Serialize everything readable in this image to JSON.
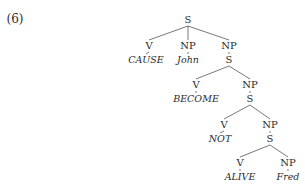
{
  "example_number": "(6)",
  "tree": {
    "nodes": [
      {
        "id": "s0",
        "label": "S",
        "x": 188,
        "y": 20,
        "kind": "cat"
      },
      {
        "id": "v1",
        "label": "V",
        "x": 149,
        "y": 46,
        "kind": "cat"
      },
      {
        "id": "w1",
        "label": "CAUSE",
        "x": 146,
        "y": 60,
        "kind": "word"
      },
      {
        "id": "np1",
        "label": "NP",
        "x": 188,
        "y": 46,
        "kind": "cat"
      },
      {
        "id": "w2",
        "label": "John",
        "x": 188,
        "y": 60,
        "kind": "word"
      },
      {
        "id": "np2",
        "label": "NP",
        "x": 229,
        "y": 46,
        "kind": "cat"
      },
      {
        "id": "s1",
        "label": "S",
        "x": 229,
        "y": 60,
        "kind": "cat"
      },
      {
        "id": "v2",
        "label": "V",
        "x": 196,
        "y": 85,
        "kind": "cat"
      },
      {
        "id": "w3",
        "label": "BECOME",
        "x": 196,
        "y": 99,
        "kind": "word"
      },
      {
        "id": "np3",
        "label": "NP",
        "x": 250,
        "y": 85,
        "kind": "cat"
      },
      {
        "id": "s2",
        "label": "S",
        "x": 250,
        "y": 99,
        "kind": "cat"
      },
      {
        "id": "v3",
        "label": "V",
        "x": 224,
        "y": 125,
        "kind": "cat"
      },
      {
        "id": "w4",
        "label": "NOT",
        "x": 220,
        "y": 139,
        "kind": "word"
      },
      {
        "id": "np4",
        "label": "NP",
        "x": 270,
        "y": 125,
        "kind": "cat"
      },
      {
        "id": "s3",
        "label": "S",
        "x": 270,
        "y": 139,
        "kind": "cat"
      },
      {
        "id": "v4",
        "label": "V",
        "x": 240,
        "y": 163,
        "kind": "cat"
      },
      {
        "id": "w5",
        "label": "ALIVE",
        "x": 240,
        "y": 177,
        "kind": "word"
      },
      {
        "id": "np5",
        "label": "NP",
        "x": 288,
        "y": 163,
        "kind": "cat"
      },
      {
        "id": "w6",
        "label": "Fred",
        "x": 288,
        "y": 177,
        "kind": "word"
      }
    ],
    "edges": [
      [
        "s0",
        "v1"
      ],
      [
        "s0",
        "np1"
      ],
      [
        "s0",
        "np2"
      ],
      [
        "v1",
        "w1"
      ],
      [
        "np1",
        "w2"
      ],
      [
        "np2",
        "s1"
      ],
      [
        "s1",
        "v2"
      ],
      [
        "s1",
        "np3"
      ],
      [
        "v2",
        "w3"
      ],
      [
        "np3",
        "s2"
      ],
      [
        "s2",
        "v3"
      ],
      [
        "s2",
        "np4"
      ],
      [
        "v3",
        "w4"
      ],
      [
        "np4",
        "s3"
      ],
      [
        "s3",
        "v4"
      ],
      [
        "s3",
        "np5"
      ],
      [
        "v4",
        "w5"
      ],
      [
        "np5",
        "w6"
      ]
    ]
  },
  "colors": {
    "line": "#555555",
    "text": "#2a2a2a"
  }
}
